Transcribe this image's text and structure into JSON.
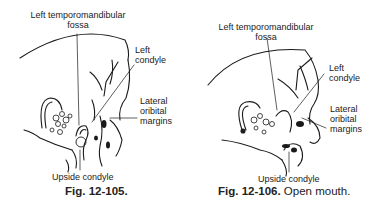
{
  "figures": [
    {
      "id": "fig-12-105",
      "labels": {
        "fossa_line1": "Left temporomandibular",
        "fossa_line2": "fossa",
        "condyle_line1": "Left",
        "condyle_line2": "condyle",
        "orbital_line1": "Lateral",
        "orbital_line2": "oribital",
        "orbital_line3": "margins",
        "upside": "Upside condyle"
      },
      "caption": {
        "number": "Fig. 12-105.",
        "text": ""
      }
    },
    {
      "id": "fig-12-106",
      "labels": {
        "fossa_line1": "Left temporomandibular",
        "fossa_line2": "fossa",
        "condyle_line1": "Left",
        "condyle_line2": "condyle",
        "orbital_line1": "Lateral",
        "orbital_line2": "oribital",
        "orbital_line3": "margins",
        "upside": "Upside condyle"
      },
      "caption": {
        "number": "Fig. 12-106.",
        "text": "Open mouth."
      }
    }
  ]
}
